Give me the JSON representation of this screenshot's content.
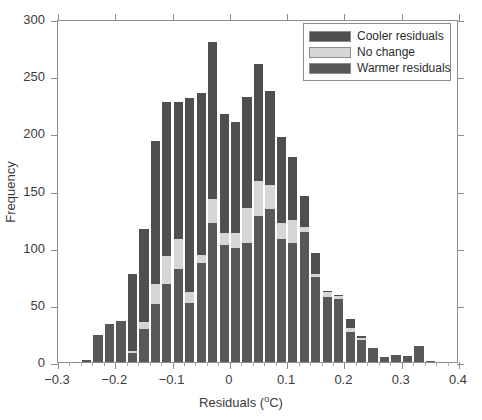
{
  "chart_data": {
    "type": "bar",
    "subtype": "stacked-histogram",
    "title": "",
    "xlabel": "Residuals (  °C)",
    "xlabel_text": "Residuals (",
    "xlabel_degree": "o",
    "xlabel_tail": "C)",
    "ylabel": "Frequency",
    "xlim": [
      -0.3,
      0.4
    ],
    "ylim": [
      0,
      300
    ],
    "xticks": [
      -0.3,
      -0.2,
      -0.1,
      0,
      0.1,
      0.2,
      0.3,
      0.4
    ],
    "xtick_labels": [
      "−0.3",
      "−0.2",
      "−0.1",
      "0",
      "0.1",
      "0.2",
      "0.3",
      "0.4"
    ],
    "yticks": [
      0,
      50,
      100,
      150,
      200,
      250,
      300
    ],
    "ytick_labels": [
      "0",
      "50",
      "100",
      "150",
      "200",
      "250",
      "300"
    ],
    "grid": false,
    "legend_position": "top-right",
    "bin_width": 0.02,
    "bin_centers": [
      -0.25,
      -0.23,
      -0.21,
      -0.19,
      -0.17,
      -0.15,
      -0.13,
      -0.11,
      -0.09,
      -0.07,
      -0.05,
      -0.03,
      -0.01,
      0.01,
      0.03,
      0.05,
      0.07,
      0.09,
      0.11,
      0.13,
      0.15,
      0.17,
      0.19,
      0.21,
      0.23,
      0.25,
      0.27,
      0.29,
      0.31,
      0.33,
      0.35
    ],
    "bin_left_edges": [
      -0.26,
      -0.24,
      -0.22,
      -0.2,
      -0.18,
      -0.16,
      -0.14,
      -0.12,
      -0.1,
      -0.08,
      -0.06,
      -0.04,
      -0.02,
      0.0,
      0.02,
      0.04,
      0.06,
      0.08,
      0.1,
      0.12,
      0.14,
      0.16,
      0.18,
      0.2,
      0.22,
      0.24,
      0.26,
      0.28,
      0.3,
      0.32,
      0.34
    ],
    "categories": [
      "-0.25",
      "-0.23",
      "-0.21",
      "-0.19",
      "-0.17",
      "-0.15",
      "-0.13",
      "-0.11",
      "-0.09",
      "-0.07",
      "-0.05",
      "-0.03",
      "-0.01",
      "0.01",
      "0.03",
      "0.05",
      "0.07",
      "0.09",
      "0.11",
      "0.13",
      "0.15",
      "0.17",
      "0.19",
      "0.21",
      "0.23",
      "0.25",
      "0.27",
      "0.29",
      "0.31",
      "0.33",
      "0.35"
    ],
    "series": [
      {
        "name": "Warmer residuals",
        "color": "#585858",
        "stack_order": 0,
        "values": [
          2,
          24,
          33,
          36,
          8,
          29,
          51,
          68,
          81,
          52,
          87,
          122,
          102,
          100,
          104,
          128,
          134,
          108,
          104,
          114,
          74,
          57,
          55,
          26,
          19,
          12,
          4,
          6,
          5,
          14,
          1
        ]
      },
      {
        "name": "No change",
        "color": "#d6d6d6",
        "stack_order": 1,
        "values": [
          0,
          0,
          0,
          0,
          2,
          6,
          17,
          25,
          27,
          9,
          7,
          21,
          11,
          13,
          31,
          30,
          21,
          14,
          20,
          4,
          3,
          4,
          3,
          4,
          2,
          0,
          0,
          0,
          0,
          0,
          0
        ]
      },
      {
        "name": "Cooler residuals",
        "color": "#4f4f4f",
        "stack_order": 2,
        "values": [
          0,
          0,
          0,
          0,
          67,
          81,
          125,
          134,
          119,
          170,
          141,
          137,
          104,
          97,
          97,
          103,
          82,
          75,
          55,
          27,
          18,
          1,
          1,
          8,
          2,
          0,
          0,
          0,
          0,
          0,
          0
        ]
      }
    ],
    "totals": [
      2,
      24,
      33,
      36,
      77,
      116,
      193,
      227,
      227,
      231,
      235,
      280,
      217,
      210,
      232,
      261,
      237,
      197,
      179,
      145,
      95,
      62,
      59,
      38,
      23,
      12,
      4,
      6,
      5,
      14,
      1
    ]
  },
  "legend": {
    "items": [
      {
        "label": "Cooler residuals",
        "color": "#4f4f4f"
      },
      {
        "label": "No change",
        "color": "#d6d6d6"
      },
      {
        "label": "Warmer residuals",
        "color": "#585858"
      }
    ]
  },
  "colors": {
    "axis": "#8d8d8d",
    "text": "#3b3b3b",
    "background": "#ffffff"
  }
}
